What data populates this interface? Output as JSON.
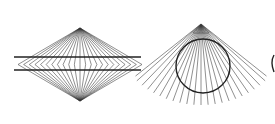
{
  "figures": [
    {
      "name": "hering-illusion",
      "apex_top": [
        80,
        28
      ],
      "apex_bottom": [
        80,
        101
      ],
      "horizontal_lines_y": [
        57,
        70
      ],
      "horizontal_extent": [
        14,
        141
      ],
      "ray_count": 22,
      "color": "#222222"
    },
    {
      "name": "orbison-circle-illusion",
      "apex": [
        201,
        24
      ],
      "circle_center": [
        203,
        66
      ],
      "circle_radius": 27,
      "ray_count": 22,
      "color": "#222222"
    }
  ]
}
